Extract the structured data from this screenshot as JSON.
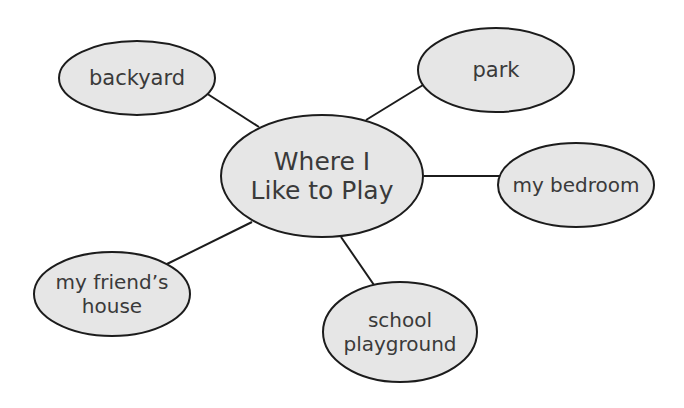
{
  "diagram": {
    "type": "web / bubble map",
    "colors": {
      "background": "#ffffff",
      "bubble_fill": "#e6e6e6",
      "outline": "#1c1c1c",
      "text": "#3a3a3a"
    },
    "center": {
      "id": "center",
      "lines": [
        "Where I",
        "Like to Play"
      ],
      "cx": 322,
      "cy": 176,
      "rx": 101,
      "ry": 61,
      "font_size": 25
    },
    "nodes": [
      {
        "id": "backyard",
        "lines": [
          "backyard"
        ],
        "cx": 137,
        "cy": 78,
        "rx": 78,
        "ry": 37,
        "font_size": 21,
        "edge": {
          "x1": 206,
          "y1": 93,
          "x2": 259,
          "y2": 127
        }
      },
      {
        "id": "park",
        "lines": [
          "park"
        ],
        "cx": 496,
        "cy": 70,
        "rx": 78,
        "ry": 42,
        "font_size": 21,
        "edge": {
          "x1": 423,
          "y1": 85,
          "x2": 366,
          "y2": 120
        }
      },
      {
        "id": "my-bedroom",
        "lines": [
          "my bedroom"
        ],
        "cx": 576,
        "cy": 185,
        "rx": 78,
        "ry": 42,
        "font_size": 20,
        "edge": {
          "x1": 424,
          "y1": 176,
          "x2": 500,
          "y2": 176
        }
      },
      {
        "id": "my-friends-house",
        "lines": [
          "my friend’s",
          "house"
        ],
        "cx": 112,
        "cy": 294,
        "rx": 78,
        "ry": 42,
        "font_size": 20,
        "edge": {
          "x1": 167,
          "y1": 264,
          "x2": 252,
          "y2": 222
        }
      },
      {
        "id": "school-playground",
        "lines": [
          "school",
          "playground"
        ],
        "cx": 400,
        "cy": 332,
        "rx": 77,
        "ry": 50,
        "font_size": 20,
        "edge": {
          "x1": 341,
          "y1": 237,
          "x2": 374,
          "y2": 285
        }
      }
    ]
  }
}
